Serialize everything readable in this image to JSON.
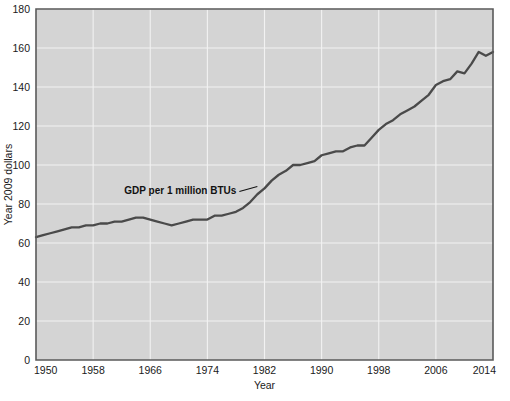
{
  "figure": {
    "background_color": "#ffffff",
    "plot_background_color": "#d4d4d4",
    "gridline_color": "#f2f2f2",
    "line_color": "#4a4a4a",
    "axis_color": "#5a5a5a"
  },
  "axes": {
    "y_title": "Year 2009 dollars",
    "x_title": "Year"
  },
  "annotation": {
    "label": "GDP per 1 million BTUs"
  },
  "chart_data": {
    "type": "line",
    "title": "",
    "subtitle": "",
    "xlabel": "Year",
    "ylabel": "Year 2009 dollars",
    "xlim": [
      1950,
      2014
    ],
    "ylim": [
      0,
      180
    ],
    "grid": true,
    "legend": "none",
    "annotations": [
      {
        "text": "GDP per 1 million BTUs",
        "points_to_year": 1981,
        "points_to_value": 89
      }
    ],
    "xticks": [
      1950,
      1958,
      1966,
      1974,
      1982,
      1990,
      1998,
      2006,
      2014
    ],
    "xtick_labels": [
      "1950",
      "1958",
      "1966",
      "1974",
      "1982",
      "1990",
      "1998",
      "2006",
      "2014"
    ],
    "yticks": [
      0,
      20,
      40,
      60,
      80,
      100,
      120,
      140,
      160,
      180
    ],
    "ytick_labels": [
      "0",
      "20",
      "40",
      "60",
      "80",
      "100",
      "120",
      "140",
      "160",
      "180"
    ],
    "series": [
      {
        "name": "GDP per 1 million BTUs",
        "x": [
          1950,
          1951,
          1952,
          1953,
          1954,
          1955,
          1956,
          1957,
          1958,
          1959,
          1960,
          1961,
          1962,
          1963,
          1964,
          1965,
          1966,
          1967,
          1968,
          1969,
          1970,
          1971,
          1972,
          1973,
          1974,
          1975,
          1976,
          1977,
          1978,
          1979,
          1980,
          1981,
          1982,
          1983,
          1984,
          1985,
          1986,
          1987,
          1988,
          1989,
          1990,
          1991,
          1992,
          1993,
          1994,
          1995,
          1996,
          1997,
          1998,
          1999,
          2000,
          2001,
          2002,
          2003,
          2004,
          2005,
          2006,
          2007,
          2008,
          2009,
          2010,
          2011,
          2012,
          2013,
          2014
        ],
        "values": [
          63,
          64,
          65,
          66,
          67,
          68,
          68,
          69,
          69,
          70,
          70,
          71,
          71,
          72,
          73,
          73,
          72,
          71,
          70,
          69,
          70,
          71,
          72,
          72,
          72,
          74,
          74,
          75,
          76,
          78,
          81,
          85,
          88,
          92,
          95,
          97,
          100,
          100,
          101,
          102,
          105,
          106,
          107,
          107,
          109,
          110,
          110,
          114,
          118,
          121,
          123,
          126,
          128,
          130,
          133,
          136,
          141,
          143,
          144,
          148,
          147,
          152,
          158,
          156,
          158
        ]
      }
    ]
  }
}
